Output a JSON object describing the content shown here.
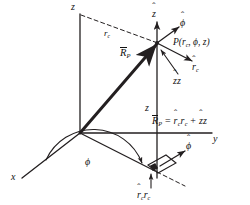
{
  "figure": {
    "background_color": "#ffffff",
    "line_color": "#231f20",
    "text_color": "#111111"
  },
  "axes": {
    "z_label": "z",
    "y_label": "y",
    "x_label": "x"
  },
  "labels": {
    "radial_distance": "r",
    "radial_distance_sub": "c",
    "height": "z",
    "angle": "ϕ",
    "point_prefix": "P(",
    "point_r": "r",
    "point_r_sub": "c",
    "point_sep1": ", ",
    "point_phi": "ϕ",
    "point_sep2": ", ",
    "point_z": "z",
    "point_suffix": ")"
  },
  "vectors": {
    "position_vector": "R",
    "position_vector_sub": "P",
    "unit_z": "z",
    "unit_phi": "ϕ",
    "unit_r": "r",
    "unit_r_sub": "c",
    "hat_mark": "ˆ",
    "z_component": {
      "unit": "z",
      "magnitude": "z"
    },
    "r_component": {
      "unit": "r",
      "unit_sub": "c",
      "magnitude": "r",
      "magnitude_sub": "c"
    }
  },
  "equation": {
    "lhs": "R",
    "lhs_sub": "P",
    "equals": " = ",
    "term1_unit": "r",
    "term1_unit_sub": "c",
    "term1_mag": "r",
    "term1_mag_sub": "c",
    "plus": " + ",
    "term2_unit": "z",
    "term2_mag": "z"
  }
}
